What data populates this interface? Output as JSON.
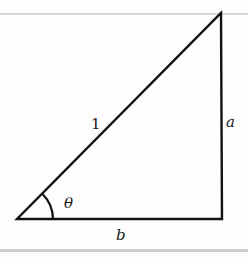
{
  "diagram": {
    "type": "right-triangle",
    "vertices": {
      "bottom_left": [
        17,
        219
      ],
      "bottom_right": [
        222,
        219
      ],
      "top_right": [
        221,
        13
      ]
    },
    "labels": {
      "hypotenuse": "1",
      "vertical_side": "a",
      "horizontal_side": "b",
      "angle": "θ"
    },
    "colors": {
      "stroke": "#111111",
      "rule": "#d0d0d0",
      "background": "#fdfdfd"
    }
  }
}
